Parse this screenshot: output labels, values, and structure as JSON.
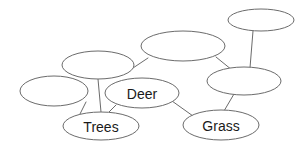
{
  "diagram": {
    "type": "node-link-graph",
    "background_color": "#ffffff",
    "stroke_color": "#6b6b6b",
    "label_color": "#1a1a1a",
    "width": 307,
    "height": 150,
    "nodes": [
      {
        "id": "n-top-right",
        "label": "",
        "cx": 261,
        "cy": 20,
        "rx": 33,
        "ry": 11
      },
      {
        "id": "n-top-middle",
        "label": "",
        "cx": 183,
        "cy": 46,
        "rx": 42,
        "ry": 15
      },
      {
        "id": "n-right-middle",
        "label": "",
        "cx": 244,
        "cy": 81,
        "rx": 37,
        "ry": 14
      },
      {
        "id": "n-left-upper",
        "label": "",
        "cx": 98,
        "cy": 65,
        "rx": 36,
        "ry": 14
      },
      {
        "id": "n-far-left",
        "label": "",
        "cx": 54,
        "cy": 91,
        "rx": 34,
        "ry": 15
      },
      {
        "id": "n-deer",
        "label": "Deer",
        "cx": 142,
        "cy": 93,
        "rx": 37,
        "ry": 15
      },
      {
        "id": "n-trees",
        "label": "Trees",
        "cx": 101,
        "cy": 126,
        "rx": 38,
        "ry": 14
      },
      {
        "id": "n-grass",
        "label": "Grass",
        "cx": 221,
        "cy": 125,
        "rx": 38,
        "ry": 15
      }
    ],
    "edges": [
      {
        "id": "e-topright-rightmiddle",
        "from": "n-top-right",
        "to": "n-right-middle",
        "x1": 253,
        "y1": 31,
        "x2": 250,
        "y2": 68
      },
      {
        "id": "e-topmiddle-rightmiddle",
        "from": "n-top-middle",
        "to": "n-right-middle",
        "x1": 216,
        "y1": 57,
        "x2": 232,
        "y2": 70
      },
      {
        "id": "e-leftupper-topmiddle",
        "from": "n-left-upper",
        "to": "n-top-middle",
        "x1": 133,
        "y1": 68,
        "x2": 148,
        "y2": 58
      },
      {
        "id": "e-leftupper-trees",
        "from": "n-left-upper",
        "to": "n-trees",
        "x1": 98,
        "y1": 79,
        "x2": 101,
        "y2": 112
      },
      {
        "id": "e-farleft-trees",
        "from": "n-far-left",
        "to": "n-trees",
        "x1": 86,
        "y1": 102,
        "x2": 80,
        "y2": 114
      },
      {
        "id": "e-deer-trees",
        "from": "n-deer",
        "to": "n-trees",
        "x1": 116,
        "y1": 105,
        "x2": 109,
        "y2": 112
      },
      {
        "id": "e-deer-grass",
        "from": "n-deer",
        "to": "n-grass",
        "x1": 172,
        "y1": 101,
        "x2": 193,
        "y2": 116
      },
      {
        "id": "e-rightmiddle-grass",
        "from": "n-right-middle",
        "to": "n-grass",
        "x1": 234,
        "y1": 94,
        "x2": 224,
        "y2": 111
      }
    ]
  }
}
